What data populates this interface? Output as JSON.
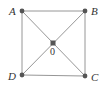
{
  "diagram": {
    "type": "square-with-diagonals",
    "colors": {
      "line": "#8a8a8a",
      "point": "#555555",
      "label": "#333333",
      "background": "#ffffff"
    },
    "points": [
      {
        "id": "A",
        "label": "A",
        "x": 22,
        "y": 11,
        "label_x": 9,
        "label_y": 15
      },
      {
        "id": "B",
        "label": "B",
        "x": 85,
        "y": 11,
        "label_x": 91,
        "label_y": 15
      },
      {
        "id": "C",
        "label": "C",
        "x": 85,
        "y": 76,
        "label_x": 91,
        "label_y": 81
      },
      {
        "id": "D",
        "label": "D",
        "x": 22,
        "y": 75,
        "label_x": 8,
        "label_y": 80
      },
      {
        "id": "O",
        "label": "0",
        "x": 53,
        "y": 43,
        "label_x": 50,
        "label_y": 55
      }
    ],
    "segments": [
      [
        "A",
        "B"
      ],
      [
        "B",
        "C"
      ],
      [
        "C",
        "D"
      ],
      [
        "D",
        "A"
      ],
      [
        "A",
        "C"
      ],
      [
        "B",
        "D"
      ]
    ]
  }
}
